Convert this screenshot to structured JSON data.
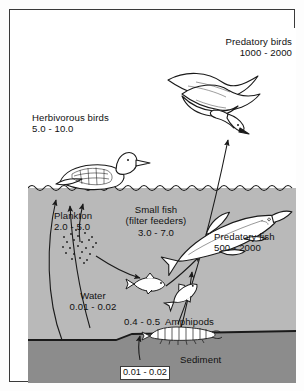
{
  "diagram": {
    "colors": {
      "water": "#b9b9b9",
      "sediment": "#8c8c8c",
      "sky": "#ffffff",
      "ink": "#1a1a1a",
      "frame": "#3a3a3a"
    },
    "labels": {
      "predatory_birds": {
        "name": "Predatory birds",
        "value": "1000 - 2000"
      },
      "herbivorous_birds": {
        "name": "Herbivorous birds",
        "value": "5.0 - 10.0"
      },
      "plankton": {
        "name": "Plankton",
        "value": "2.0 - 5.0"
      },
      "small_fish": {
        "name": "Small fish",
        "qualifier": "(filter feeders)",
        "value": "3.0 - 7.0"
      },
      "predatory_fish": {
        "name": "Predatory fish",
        "value": "500 - 2000"
      },
      "water": {
        "name": "Water",
        "value": "0.01 - 0.02"
      },
      "amphipods": {
        "name": "Amphipods",
        "value": "0.4 - 0.5",
        "combined": "0.4 - 0.5  Amphipods"
      },
      "sediment": {
        "name": "Sediment",
        "value": "0.01 - 0.02"
      }
    },
    "organisms": [
      {
        "id": "gull",
        "label": "Predatory birds",
        "zone": "air"
      },
      {
        "id": "loon",
        "label": "Herbivorous birds",
        "zone": "surface"
      },
      {
        "id": "plankton-cloud",
        "label": "Plankton",
        "zone": "water"
      },
      {
        "id": "small-fish-1",
        "label": "Small fish",
        "zone": "water"
      },
      {
        "id": "small-fish-2",
        "label": "Small fish",
        "zone": "water"
      },
      {
        "id": "pike",
        "label": "Predatory fish",
        "zone": "water"
      },
      {
        "id": "amphipod",
        "label": "Amphipods",
        "zone": "benthic"
      }
    ],
    "flows": [
      {
        "from": "water",
        "to": "plankton"
      },
      {
        "from": "water",
        "to": "herbivorous_birds"
      },
      {
        "from": "plankton",
        "to": "herbivorous_birds"
      },
      {
        "from": "plankton",
        "to": "small_fish"
      },
      {
        "from": "sediment",
        "to": "amphipods"
      },
      {
        "from": "amphipods",
        "to": "small_fish"
      },
      {
        "from": "small_fish",
        "to": "predatory_fish"
      },
      {
        "from": "predatory_fish",
        "to": "predatory_birds"
      }
    ]
  }
}
